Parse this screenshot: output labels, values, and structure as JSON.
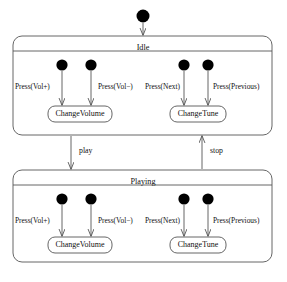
{
  "diagram": {
    "type": "uml-state-machine",
    "title": "",
    "background_color": "#ffffff",
    "stroke_color": "#555555",
    "fill_color": "#ffffff",
    "node_fill_color": "#000000",
    "text_color": "#111111",
    "initial_node": {
      "name": "initial-pseudostate",
      "cx": 143,
      "cy": 16,
      "r": 6.5
    },
    "states": [
      {
        "id": "idle",
        "label": "Idle",
        "x": 13,
        "y": 36,
        "width": 259,
        "height": 99,
        "header_height": 15,
        "title_x": 143,
        "title_y": 44,
        "initials": [
          {
            "name": "initial-idle-volup",
            "cx": 62,
            "cy": 65,
            "r": 5.6
          },
          {
            "name": "initial-idle-voldown",
            "cx": 91,
            "cy": 65,
            "r": 5.6
          },
          {
            "name": "initial-idle-next",
            "cx": 184,
            "cy": 65,
            "r": 5.6
          },
          {
            "name": "initial-idle-previous",
            "cx": 208,
            "cy": 65,
            "r": 5.6
          }
        ],
        "actions": [
          {
            "id": "idle-changevolume",
            "label": "ChangeVolume",
            "x": 48,
            "y": 106,
            "width": 64,
            "height": 16
          },
          {
            "id": "idle-changetune",
            "label": "ChangeTune",
            "x": 170,
            "y": 106,
            "width": 56,
            "height": 16
          }
        ],
        "events": [
          {
            "id": "idle-ev-volup",
            "label": "Press(Vol+)",
            "x": 15,
            "y": 83,
            "from_x": 62,
            "from_y": 71,
            "to_x": 62,
            "to_y": 105
          },
          {
            "id": "idle-ev-voldown",
            "label": "Press(Vol−)",
            "x": 98,
            "y": 83,
            "from_x": 91,
            "from_y": 71,
            "to_x": 91,
            "to_y": 105
          },
          {
            "id": "idle-ev-next",
            "label": "Press(Next)",
            "x": 145,
            "y": 83,
            "from_x": 184,
            "from_y": 71,
            "to_x": 184,
            "to_y": 105
          },
          {
            "id": "idle-ev-previous",
            "label": "Press(Previous)",
            "x": 213,
            "y": 83,
            "from_x": 208,
            "from_y": 71,
            "to_x": 208,
            "to_y": 105
          }
        ]
      },
      {
        "id": "playing",
        "label": "Playing",
        "x": 13,
        "y": 170,
        "width": 259,
        "height": 92,
        "header_height": 15,
        "title_x": 143,
        "title_y": 178,
        "initials": [
          {
            "name": "initial-playing-volup",
            "cx": 62,
            "cy": 199,
            "r": 5.6
          },
          {
            "name": "initial-playing-voldown",
            "cx": 91,
            "cy": 199,
            "r": 5.6
          },
          {
            "name": "initial-playing-next",
            "cx": 184,
            "cy": 199,
            "r": 5.6
          },
          {
            "name": "initial-playing-previous",
            "cx": 208,
            "cy": 199,
            "r": 5.6
          }
        ],
        "actions": [
          {
            "id": "playing-changevolume",
            "label": "ChangeVolume",
            "x": 48,
            "y": 237,
            "width": 64,
            "height": 16
          },
          {
            "id": "playing-changetune",
            "label": "ChangeTune",
            "x": 170,
            "y": 237,
            "width": 56,
            "height": 16
          }
        ],
        "events": [
          {
            "id": "playing-ev-volup",
            "label": "Press(Vol+)",
            "x": 15,
            "y": 217,
            "from_x": 62,
            "from_y": 205,
            "to_x": 62,
            "to_y": 236
          },
          {
            "id": "playing-ev-voldown",
            "label": "Press(Vol−)",
            "x": 98,
            "y": 217,
            "from_x": 91,
            "from_y": 205,
            "to_x": 91,
            "to_y": 236
          },
          {
            "id": "playing-ev-next",
            "label": "Press(Next)",
            "x": 145,
            "y": 217,
            "from_x": 184,
            "from_y": 205,
            "to_x": 184,
            "to_y": 236
          },
          {
            "id": "playing-ev-previous",
            "label": "Press(Previous)",
            "x": 213,
            "y": 217,
            "from_x": 208,
            "from_y": 205,
            "to_x": 208,
            "to_y": 236
          }
        ]
      }
    ],
    "transitions": [
      {
        "id": "initial-to-idle",
        "label": "",
        "from_x": 143,
        "from_y": 23,
        "to_x": 143,
        "to_y": 35
      },
      {
        "id": "idle-to-playing",
        "label": "play",
        "label_x": 79,
        "label_y": 147,
        "from_x": 71,
        "from_y": 136,
        "to_x": 71,
        "to_y": 169
      },
      {
        "id": "playing-to-idle",
        "label": "stop",
        "label_x": 210,
        "label_y": 147,
        "from_x": 202,
        "from_y": 169,
        "to_x": 202,
        "to_y": 136
      }
    ]
  }
}
